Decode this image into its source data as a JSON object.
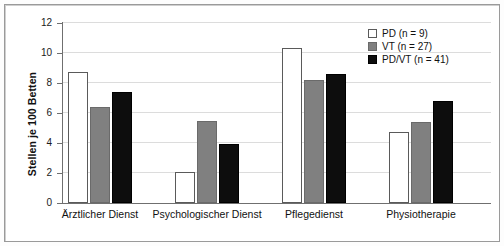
{
  "chart_data": {
    "type": "bar",
    "title": "",
    "subtitle": "",
    "xlabel": "",
    "ylabel": "Stellen je 100 Betten",
    "ylim": [
      0,
      12
    ],
    "yticks": [
      0,
      2,
      4,
      6,
      8,
      10,
      12
    ],
    "ytick_labels": [
      "0",
      "2",
      "4",
      "6",
      "8",
      "10",
      "12"
    ],
    "grid": "horizontal",
    "legend_position": "top-right",
    "categories": [
      "Ärztlicher Dienst",
      "Psychologischer Dienst",
      "Pflegedienst",
      "Physiotherapie"
    ],
    "series": [
      {
        "name": "PD (n = 9)",
        "color": "#ffffff",
        "values": [
          8.75,
          2.1,
          10.35,
          4.75
        ]
      },
      {
        "name": "VT (n = 27)",
        "color": "#808080",
        "values": [
          6.4,
          5.5,
          8.2,
          5.4
        ]
      },
      {
        "name": "PD/VT (n = 41)",
        "color": "#0d0d0d",
        "values": [
          7.4,
          3.95,
          8.6,
          6.8
        ]
      }
    ]
  },
  "legend": {
    "items": [
      {
        "label": "PD (n = 9)",
        "swatch": "pd"
      },
      {
        "label": "VT (n = 27)",
        "swatch": "vt"
      },
      {
        "label": "PD/VT (n = 41)",
        "swatch": "pdvt"
      }
    ]
  },
  "colors": {
    "series_pd": "#ffffff",
    "series_vt": "#808080",
    "series_pdvt": "#0d0d0d",
    "axis": "#6f6f6f",
    "gridline": "#dcdcdc",
    "frame": "#9a9a9a",
    "text": "#111111",
    "background": "#ffffff"
  }
}
